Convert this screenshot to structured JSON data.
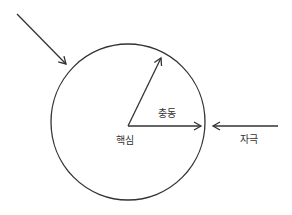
{
  "diagram": {
    "labels": {
      "impulse": "충동",
      "core": "핵심",
      "stimulus": "자극"
    },
    "colors": {
      "stroke": "#333333",
      "background": "#ffffff"
    }
  }
}
